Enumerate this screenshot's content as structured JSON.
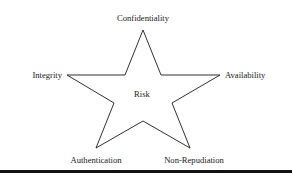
{
  "diagram": {
    "type": "star",
    "center_label": "Risk",
    "points": [
      {
        "label": "Confidentiality",
        "position": "top"
      },
      {
        "label": "Availability",
        "position": "right"
      },
      {
        "label": "Non-Repudiation",
        "position": "bottom-right"
      },
      {
        "label": "Authentication",
        "position": "bottom-left"
      },
      {
        "label": "Integrity",
        "position": "left"
      }
    ],
    "stroke_color": "#1a1a1a",
    "fill_color": "#ffffff"
  }
}
